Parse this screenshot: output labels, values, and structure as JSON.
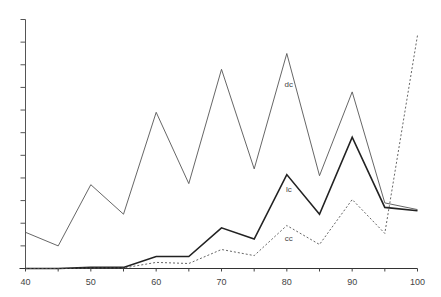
{
  "chart_data": {
    "type": "line",
    "title": "",
    "xlabel": "",
    "ylabel": "",
    "x": [
      40,
      45,
      50,
      55,
      60,
      65,
      70,
      75,
      80,
      85,
      90,
      95,
      100
    ],
    "xlim": [
      40,
      100
    ],
    "x_ticks": [
      40,
      50,
      60,
      70,
      80,
      90,
      100
    ],
    "x_tick_labels": [
      "40",
      "50",
      "60",
      "70",
      "80",
      "90",
      "100"
    ],
    "ylim": [
      0,
      11
    ],
    "y_ticks": [
      0,
      1,
      2,
      3,
      4,
      5,
      6,
      7,
      8,
      9,
      10,
      11
    ],
    "y_tick_labels": [],
    "grid": false,
    "legend": "inline labels",
    "series": [
      {
        "name": "dc",
        "style": "solid-thin",
        "values": [
          1.6,
          1.0,
          3.7,
          2.4,
          6.9,
          3.75,
          8.8,
          4.4,
          9.5,
          4.1,
          7.8,
          2.9,
          2.6
        ]
      },
      {
        "name": "lc",
        "style": "solid-thick",
        "values": [
          0,
          0,
          0.05,
          0.05,
          0.53,
          0.53,
          1.8,
          1.3,
          4.15,
          2.4,
          5.8,
          2.7,
          2.55
        ]
      },
      {
        "name": "cc",
        "style": "dashed",
        "values": [
          0,
          0,
          0.02,
          0.02,
          0.27,
          0.22,
          0.84,
          0.57,
          1.9,
          1.06,
          3.05,
          1.55,
          10.3
        ]
      }
    ],
    "annotations": [
      {
        "text": "dc",
        "x": 80,
        "y": 8.0
      },
      {
        "text": "lc",
        "x": 80,
        "y": 3.4
      },
      {
        "text": "cc",
        "x": 80,
        "y": 1.2
      }
    ]
  }
}
